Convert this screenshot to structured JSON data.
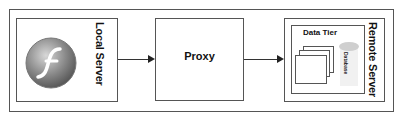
{
  "diagram": {
    "nodes": {
      "local_server": {
        "label": "Local Server",
        "icon": "flash-player-icon"
      },
      "proxy": {
        "label": "Proxy"
      },
      "remote_server": {
        "label": "Remote Server",
        "children": {
          "data_tier": {
            "label": "Data Tier",
            "database_label": "Database"
          }
        }
      }
    },
    "edges": [
      {
        "from": "Local Server",
        "to": "Proxy"
      },
      {
        "from": "Proxy",
        "to": "Remote Server"
      }
    ],
    "colors": {
      "border": "#555555",
      "arrow": "#222222",
      "database": "#cfcfcf"
    }
  }
}
